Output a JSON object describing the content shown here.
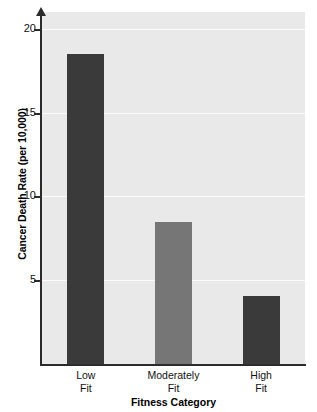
{
  "chart_data": {
    "type": "bar",
    "title": "",
    "xlabel": "Fitness Category",
    "ylabel": "Cancer Death Rate (per 10,000)",
    "categories": [
      "Low Fit",
      "Moderately Fit",
      "High Fit"
    ],
    "category_lines": [
      [
        "Low",
        "Fit"
      ],
      [
        "Moderately",
        "Fit"
      ],
      [
        "High",
        "Fit"
      ]
    ],
    "values": [
      18.5,
      8.45,
      4.05
    ],
    "bar_colors": [
      "#3a3a3a",
      "#767676",
      "#3a3a3a"
    ],
    "ylim": [
      0,
      21
    ],
    "yticks": [
      5,
      10,
      15,
      20
    ],
    "ytick_labels": [
      "5",
      "10",
      "15",
      "20"
    ],
    "grid": true,
    "gridline_color": "#fbfbfb",
    "plot_background": "#e9e9e9",
    "axis_color": "#2b2b2b",
    "legend": null
  }
}
